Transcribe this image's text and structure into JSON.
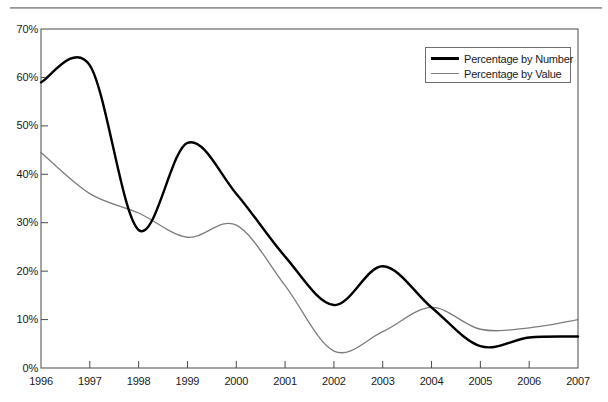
{
  "chart_data": {
    "type": "line",
    "title": "",
    "xlabel": "",
    "ylabel": "",
    "categories": [
      "1996",
      "1997",
      "1998",
      "1999",
      "2000",
      "2001",
      "2002",
      "2003",
      "2004",
      "2005",
      "2006",
      "2007"
    ],
    "x": [
      1996,
      1997,
      1998,
      1999,
      2000,
      2001,
      2002,
      2003,
      2004,
      2005,
      2006,
      2007
    ],
    "xlim": [
      1996,
      2007
    ],
    "ylim": [
      0,
      70
    ],
    "y_ticks": [
      0,
      10,
      20,
      30,
      40,
      50,
      60,
      70
    ],
    "y_tick_labels": [
      "0%",
      "10%",
      "20%",
      "30%",
      "40%",
      "50%",
      "60%",
      "70%"
    ],
    "x_tick_labels": [
      "1996",
      "1997",
      "1998",
      "1999",
      "2000",
      "2001",
      "2002",
      "2003",
      "2004",
      "2005",
      "2006",
      "2007"
    ],
    "grid": false,
    "legend_position": "top-right",
    "series": [
      {
        "name": "Percentage by Number",
        "color": "#000000",
        "line_width": 2.4,
        "values": [
          59.0,
          62.5,
          28.5,
          46.5,
          36.0,
          23.0,
          13.0,
          21.0,
          12.5,
          4.5,
          6.3,
          6.5
        ]
      },
      {
        "name": "Percentage by Value",
        "color": "#7d7d7d",
        "line_width": 1.3,
        "values": [
          44.5,
          36.0,
          32.0,
          27.0,
          29.5,
          17.0,
          3.5,
          7.5,
          12.5,
          8.0,
          8.3,
          10.0
        ]
      }
    ]
  },
  "legend": {
    "items": [
      {
        "label": "Percentage by Number"
      },
      {
        "label": "Percentage by Value"
      }
    ]
  },
  "axis": {
    "y_labels": [
      "70%",
      "60%",
      "50%",
      "40%",
      "30%",
      "20%",
      "10%",
      "0%"
    ],
    "x_labels": [
      "1996",
      "1997",
      "1998",
      "1999",
      "2000",
      "2001",
      "2002",
      "2003",
      "2004",
      "2005",
      "2006",
      "2007"
    ]
  }
}
